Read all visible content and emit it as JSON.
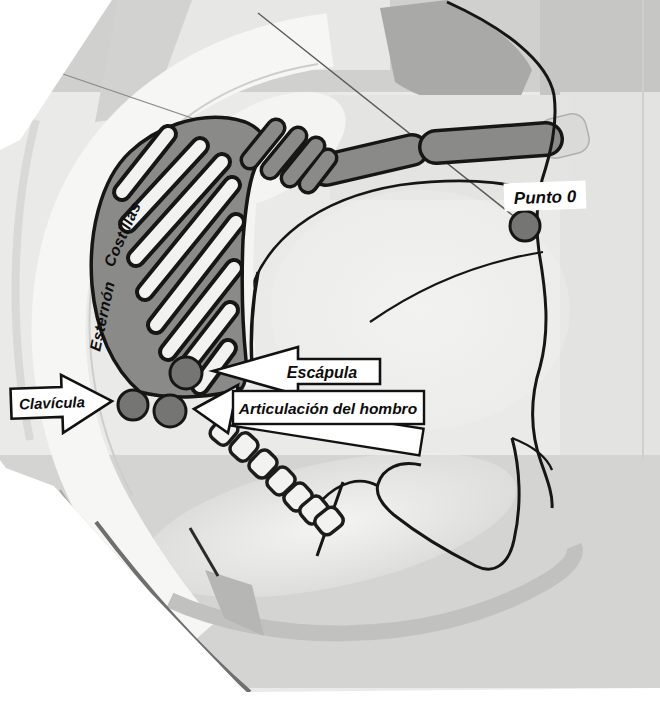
{
  "figure": {
    "kind": "scanned anatomical diagram",
    "labels": {
      "punto0": "Punto 0",
      "escapula": "Escápula",
      "clavicula": "Clavícula",
      "hombro": "Articulación del hombro",
      "esternon": "Esternón",
      "costillas": "Costillas"
    },
    "points": [
      {
        "id": "punto-0",
        "label": "Punto 0",
        "x": 525,
        "y": 226,
        "r": 15
      },
      {
        "id": "escapula",
        "label": "Escápula",
        "x": 186,
        "y": 373,
        "r": 16
      },
      {
        "id": "clavicula",
        "label": "Clavícula",
        "x": 133,
        "y": 405,
        "r": 15
      },
      {
        "id": "hombro",
        "label": "Articulación del hombro",
        "x": 170,
        "y": 411,
        "r": 16
      }
    ],
    "colors": {
      "ink": "#161616",
      "zone_gray": "#8a8a88",
      "point_fill": "#757573",
      "label_bg": "#ffffff",
      "paper": "#ffffff",
      "scan_bg": "#eaeae8"
    }
  }
}
